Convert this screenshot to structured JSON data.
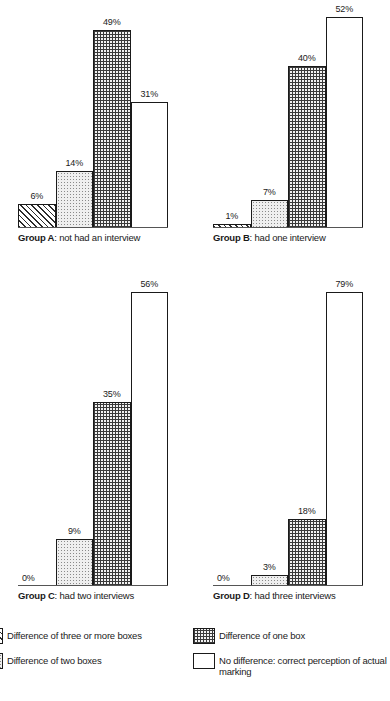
{
  "chart_data": {
    "type": "bar",
    "title": "",
    "xlabel": "",
    "ylabel": "",
    "ylim": [
      0,
      100
    ],
    "grid": false,
    "legend_position": "bottom",
    "categories": [
      "Difference of three or more boxes",
      "Difference of two boxes",
      "Difference of one box",
      "No difference: correct perception of actual marking"
    ],
    "panels": [
      {
        "id": "group-a",
        "caption_bold": "Group A",
        "caption_rest": ": not had an interview",
        "values": [
          6,
          14,
          49,
          31
        ],
        "labels": [
          "6%",
          "14%",
          "49%",
          "31%"
        ]
      },
      {
        "id": "group-b",
        "caption_bold": "Group B",
        "caption_rest": ": had one interview",
        "values": [
          1,
          7,
          40,
          52
        ],
        "labels": [
          "1%",
          "7%",
          "40%",
          "52%"
        ]
      },
      {
        "id": "group-c",
        "caption_bold": "Group C",
        "caption_rest": ": had two interviews",
        "values": [
          0,
          9,
          35,
          56
        ],
        "labels": [
          "0%",
          "9%",
          "35%",
          "56%"
        ]
      },
      {
        "id": "group-d",
        "caption_bold": "Group D",
        "caption_rest": ": had three interviews",
        "values": [
          0,
          3,
          18,
          79
        ],
        "labels": [
          "0%",
          "3%",
          "18%",
          "79%"
        ]
      }
    ]
  },
  "legend": {
    "left": [
      {
        "label": "Difference of three or more boxes",
        "pattern": "hatch"
      },
      {
        "label": "Difference of two boxes",
        "pattern": "light-dot"
      }
    ],
    "right": [
      {
        "label": "Difference of one box",
        "pattern": "dense-dot"
      },
      {
        "label": "No difference: correct perception of actual marking",
        "pattern": "white"
      }
    ]
  }
}
